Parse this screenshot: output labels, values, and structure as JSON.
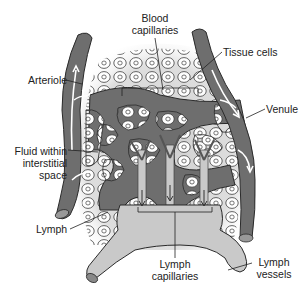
{
  "diagram": {
    "type": "anatomical-illustration",
    "labels": {
      "blood_capillaries": [
        "Blood",
        "capillaries"
      ],
      "tissue_cells": "Tissue cells",
      "arteriole": "Arteriole",
      "venule": "Venule",
      "fluid_interstitial": [
        "Fluid within",
        "interstitial",
        "space"
      ],
      "lymph": "Lymph",
      "lymph_capillaries": [
        "Lymph",
        "capillaries"
      ],
      "lymph_vessels": [
        "Lymph",
        "vessels"
      ]
    },
    "colors": {
      "vessel_fill": "#6e6e6e",
      "vessel_outline": "#2a2a2a",
      "lymph_fill": "#c9c9c9",
      "tissue_bg": "#d9d9d9",
      "cell_fill": "#ffffff",
      "flow_arrow": "#ffffff",
      "leader_line": "#222222"
    }
  }
}
